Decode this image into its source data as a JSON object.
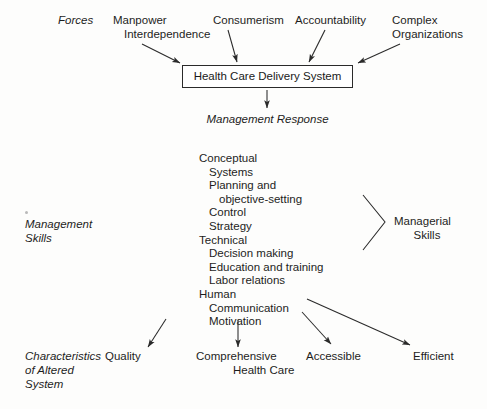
{
  "diagram": {
    "title_row_label": "Forces",
    "forces": [
      {
        "id": "manpower",
        "line1": "Manpower",
        "line2": "Interdependence"
      },
      {
        "id": "consumerism",
        "line1": "Consumerism",
        "line2": ""
      },
      {
        "id": "accountability",
        "line1": "Accountability",
        "line2": ""
      },
      {
        "id": "complex-organizations",
        "line1": "Complex",
        "line2": "Organizations"
      }
    ],
    "central_box": {
      "label": "Health Care Delivery System"
    },
    "response_label": "Management Response",
    "left_label": {
      "line1": "Management",
      "line2": "Skills"
    },
    "right_label": {
      "line1": "Managerial",
      "line2": "Skills"
    },
    "bottom_label": {
      "line1": "Characteristics",
      "line2": "of Altered",
      "line3": "System"
    },
    "skills": [
      {
        "text": "Conceptual",
        "level": 0
      },
      {
        "text": "Systems",
        "level": 1
      },
      {
        "text": "Planning and",
        "level": 1
      },
      {
        "text": "objective-setting",
        "level": 2
      },
      {
        "text": "Control",
        "level": 1
      },
      {
        "text": "Strategy",
        "level": 1
      },
      {
        "text": "Technical",
        "level": 0
      },
      {
        "text": "Decision making",
        "level": 1
      },
      {
        "text": "Education and training",
        "level": 1
      },
      {
        "text": "Labor relations",
        "level": 1
      },
      {
        "text": "Human",
        "level": 0
      },
      {
        "text": "Communication",
        "level": 1
      },
      {
        "text": "Motivation",
        "level": 1
      }
    ],
    "outcomes": [
      {
        "id": "quality",
        "line1": "Quality",
        "line2": ""
      },
      {
        "id": "comprehensive-health-care",
        "line1": "Comprehensive",
        "line2": "Health Care"
      },
      {
        "id": "accessible",
        "line1": "Accessible",
        "line2": ""
      },
      {
        "id": "efficient",
        "line1": "Efficient",
        "line2": ""
      }
    ],
    "colors": {
      "ink": "#1d1d1d",
      "stroke": "#2a2a2a",
      "background": "#fdfdfc"
    }
  }
}
